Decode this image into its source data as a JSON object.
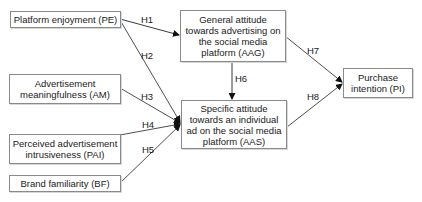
{
  "nodes": {
    "pe": "Platform enjoyment (PE)",
    "aag": "General attitude towards advertising on the social media platform (AAG)",
    "am": "Advertisement meaningfulness (AM)",
    "aas": "Specific attitude towards an individual ad on the social media platform (AAS)",
    "pai": "Perceived advertisement intrusiveness (PAI)",
    "bf": "Brand familiarity (BF)",
    "pi": "Purchase intention (PI)"
  },
  "edges": [
    {
      "id": "H1",
      "from": "pe",
      "to": "aag",
      "label": "H1"
    },
    {
      "id": "H2",
      "from": "pe",
      "to": "aas",
      "label": "H2"
    },
    {
      "id": "H3",
      "from": "am",
      "to": "aas",
      "label": "H3"
    },
    {
      "id": "H4",
      "from": "pai",
      "to": "aas",
      "label": "H4"
    },
    {
      "id": "H5",
      "from": "bf",
      "to": "aas",
      "label": "H5"
    },
    {
      "id": "H6",
      "from": "aag",
      "to": "aas",
      "label": "H6"
    },
    {
      "id": "H7",
      "from": "aag",
      "to": "pi",
      "label": "H7"
    },
    {
      "id": "H8",
      "from": "aas",
      "to": "pi",
      "label": "H8"
    }
  ]
}
